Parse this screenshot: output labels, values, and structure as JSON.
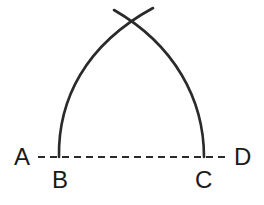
{
  "diagram": {
    "type": "geometric construction",
    "points": {
      "A": {
        "label": "A"
      },
      "B": {
        "label": "B"
      },
      "C": {
        "label": "C"
      },
      "D": {
        "label": "D"
      }
    },
    "line": {
      "from": "A",
      "to": "D",
      "style": "dashed"
    },
    "colors": {
      "stroke": "#2a2a2a",
      "text": "#1a1a1a",
      "background": "#ffffff"
    }
  }
}
